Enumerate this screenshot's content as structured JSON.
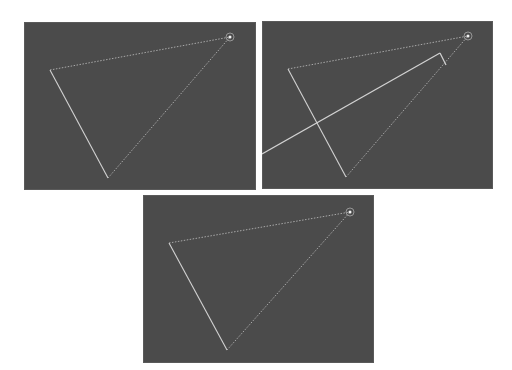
{
  "figure": {
    "background_color": "#ffffff",
    "panel_color": "#4b4b4b",
    "line_color": "#d2d2d2",
    "dim_line_color": "#a8a8a8",
    "panels": [
      {
        "id": "panel-1",
        "description": "Triangle with a light source at top-right corner",
        "rect": {
          "x": 24,
          "y": 22,
          "w": 232,
          "h": 168
        },
        "light_source": {
          "x": 206,
          "y": 15
        },
        "vertices": [
          [
            26,
            48
          ],
          [
            84,
            156
          ],
          [
            206,
            15
          ]
        ],
        "edges": [
          {
            "from": 0,
            "to": 2,
            "style": "dotted"
          },
          {
            "from": 0,
            "to": 1,
            "style": "solid"
          },
          {
            "from": 1,
            "to": 2,
            "style": "dotted"
          }
        ],
        "extra_lines": []
      },
      {
        "id": "panel-2",
        "description": "Triangle with a ray from the light crossing the shape",
        "rect": {
          "x": 262,
          "y": 21,
          "w": 231,
          "h": 168
        },
        "light_source": {
          "x": 206,
          "y": 15
        },
        "vertices": [
          [
            26,
            48
          ],
          [
            84,
            156
          ],
          [
            206,
            15
          ]
        ],
        "edges": [
          {
            "from": 0,
            "to": 2,
            "style": "dotted"
          },
          {
            "from": 0,
            "to": 1,
            "style": "solid"
          },
          {
            "from": 1,
            "to": 2,
            "style": "dotted"
          }
        ],
        "extra_lines": [
          {
            "x1": 0,
            "y1": 133,
            "x2": 178,
            "y2": 32,
            "style": "solid"
          },
          {
            "x1": 178,
            "y1": 32,
            "x2": 184,
            "y2": 44,
            "style": "solid"
          }
        ]
      },
      {
        "id": "panel-3",
        "description": "Triangle with a light source at top-right corner",
        "rect": {
          "x": 143,
          "y": 195,
          "w": 231,
          "h": 168
        },
        "light_source": {
          "x": 207,
          "y": 17
        },
        "vertices": [
          [
            26,
            48
          ],
          [
            84,
            155
          ],
          [
            207,
            17
          ]
        ],
        "edges": [
          {
            "from": 0,
            "to": 2,
            "style": "dotted"
          },
          {
            "from": 0,
            "to": 1,
            "style": "solid"
          },
          {
            "from": 1,
            "to": 2,
            "style": "dotted"
          }
        ],
        "extra_lines": []
      }
    ]
  }
}
